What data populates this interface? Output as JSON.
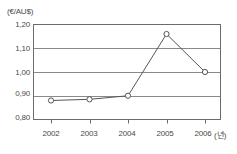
{
  "chart_data": {
    "type": "line",
    "title": "",
    "subtitle": "",
    "xlabel": "(년)",
    "ylabel": "(€/AU$)",
    "unit_label": "(€/AU$)",
    "x_unit_label": "(년)",
    "categories": [
      "2002",
      "2003",
      "2004",
      "2005",
      "2006"
    ],
    "values": [
      0.88,
      0.885,
      0.9,
      1.16,
      1.0
    ],
    "series": [
      {
        "name": "€/AU$",
        "values": [
          0.88,
          0.885,
          0.9,
          1.16,
          1.0
        ]
      }
    ],
    "ylim": [
      0.8,
      1.2
    ],
    "ytick_labels": [
      "1,20",
      "1,10",
      "1,00",
      "0,90",
      "0,80"
    ],
    "ytick_values": [
      1.2,
      1.1,
      1.0,
      0.9,
      0.8
    ],
    "xtick_labels": [
      "2002",
      "2003",
      "2004",
      "2005",
      "2006"
    ],
    "grid": "horizontal",
    "legend": "none",
    "marker": "open-circle",
    "line_color": "#555555",
    "grid_color": "#8a8a8a",
    "axis_color": "#6b6b6b",
    "text_color": "#4a4a4a",
    "background": "#ffffff"
  }
}
